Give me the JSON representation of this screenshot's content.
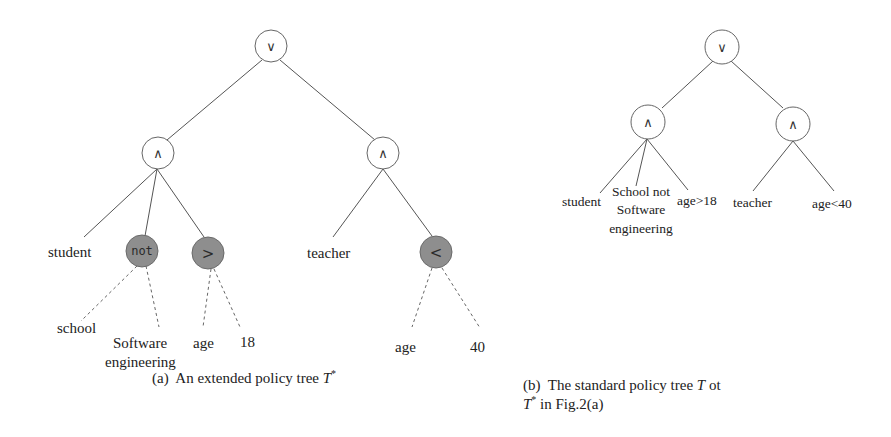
{
  "figure_a": {
    "caption_prefix": "(a)  An extended policy tree ",
    "caption_symbol": "T",
    "caption_sup": "*",
    "root": {
      "label": "∨",
      "type": "OR"
    },
    "left_and": {
      "label": "∧",
      "type": "AND"
    },
    "right_and": {
      "label": "∧",
      "type": "AND"
    },
    "leaves_left": {
      "student": "student",
      "not_node": "not",
      "gt_node": ">",
      "school": "school",
      "software_line1": "Software",
      "software_line2": "engineering",
      "age": "age",
      "eighteen": "18"
    },
    "leaves_right": {
      "teacher": "teacher",
      "lt_node": "<",
      "age": "age",
      "forty": "40"
    },
    "colors": {
      "operator_fill": "#8e8e8e",
      "gate_fill": "#ffffff"
    }
  },
  "figure_b": {
    "caption_line1_prefix": "(b)  The standard policy tree ",
    "caption_line1_symbol": "T",
    "caption_line1_suffix": " ot",
    "caption_line2_symbol": "T",
    "caption_line2_sup": "*",
    "caption_line2_suffix": " in Fig.2(a)",
    "root": {
      "label": "∨",
      "type": "OR"
    },
    "left_and": {
      "label": "∧",
      "type": "AND"
    },
    "right_and": {
      "label": "∧",
      "type": "AND"
    },
    "leaves": {
      "student": "student",
      "school_not_line1": "School not",
      "school_not_line2": "Software",
      "school_not_line3": "engineering",
      "age_gt_18": "age>18",
      "teacher": "teacher",
      "age_lt_40": "age<40"
    }
  }
}
